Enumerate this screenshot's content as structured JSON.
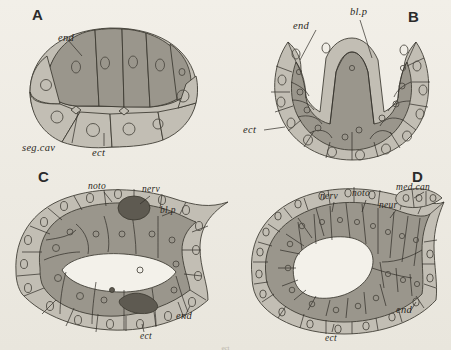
{
  "figure": {
    "background_color": "#efece5",
    "ink_color": "#2a2722",
    "endoderm_fill": "#9a968c",
    "ectoderm_fill": "#c2beb4",
    "nuclei_color": "#5d5a52",
    "cut_off_caption": "ect"
  },
  "panels": [
    {
      "id": "A",
      "letter": "A",
      "name": "blastula-section",
      "labels": [
        {
          "key": "end",
          "text": "end",
          "x": 58,
          "y": 36
        },
        {
          "key": "segcav",
          "text": "seg.cav",
          "x": 22,
          "y": 148
        },
        {
          "key": "ect",
          "text": "ect",
          "x": 92,
          "y": 152
        }
      ]
    },
    {
      "id": "B",
      "letter": "B",
      "name": "gastrula-section",
      "labels": [
        {
          "key": "blp",
          "text": "bl.p",
          "x": 352,
          "y": 12
        },
        {
          "key": "end",
          "text": "end",
          "x": 296,
          "y": 27
        },
        {
          "key": "ect",
          "text": "ect",
          "x": 245,
          "y": 130
        }
      ]
    },
    {
      "id": "C",
      "letter": "C",
      "name": "early-neurula-section",
      "labels": [
        {
          "key": "noto",
          "text": "noto",
          "x": 88,
          "y": 186
        },
        {
          "key": "nerv",
          "text": "nerv",
          "x": 142,
          "y": 190
        },
        {
          "key": "blp",
          "text": "bl.p",
          "x": 160,
          "y": 211
        },
        {
          "key": "end",
          "text": "end",
          "x": 176,
          "y": 316
        },
        {
          "key": "ect",
          "text": "ect",
          "x": 140,
          "y": 337
        }
      ]
    },
    {
      "id": "D",
      "letter": "D",
      "name": "late-neurula-section",
      "labels": [
        {
          "key": "nerv",
          "text": "nerv",
          "x": 322,
          "y": 197
        },
        {
          "key": "noto",
          "text": "noto",
          "x": 355,
          "y": 193
        },
        {
          "key": "neur",
          "text": "neur",
          "x": 382,
          "y": 206
        },
        {
          "key": "medcan",
          "text": "med.can",
          "x": 400,
          "y": 188
        },
        {
          "key": "end",
          "text": "end",
          "x": 398,
          "y": 310
        },
        {
          "key": "ect",
          "text": "ect",
          "x": 327,
          "y": 338
        }
      ]
    }
  ],
  "legend_terms": {
    "end": "endoderm",
    "ect": "ectoderm",
    "segcav": "segmentation cavity",
    "blp": "blastopore",
    "noto": "notochord",
    "nerv": "nerve",
    "neur": "neural",
    "medcan": "medullary canal"
  }
}
